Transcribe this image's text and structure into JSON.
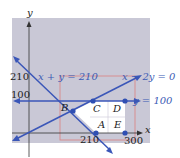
{
  "figure": {
    "axes": {
      "x_label": "x",
      "y_label": "y",
      "x_ticks": [
        "210",
        "300"
      ],
      "y_ticks": [
        "210",
        "100"
      ]
    },
    "lines": [
      {
        "equation": "x + y = 210"
      },
      {
        "equation": "x − 2y = 0"
      },
      {
        "equation": "y = 100"
      }
    ],
    "points": [
      "A",
      "B",
      "C",
      "D",
      "E"
    ],
    "colors": {
      "background_panel": "#c9c8d6",
      "line": "#3a56b8",
      "point": "#2f4fb3",
      "rectangle": "#d9888a",
      "feasible_region": "#ffffff",
      "axis": "#333333"
    }
  }
}
